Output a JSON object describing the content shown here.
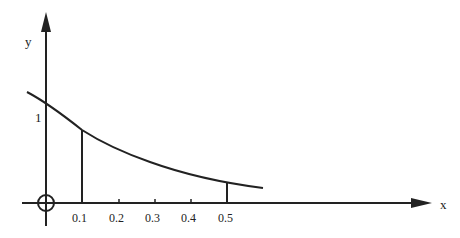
{
  "diagram": {
    "axes": {
      "x_label": "x",
      "y_label": "y",
      "origin_symbol": "circle-cross"
    },
    "y_ticks": [
      {
        "label": "1",
        "value": 1
      }
    ],
    "x_ticks": [
      {
        "label": "0.1",
        "value": 0.1
      },
      {
        "label": "0.2",
        "value": 0.2
      },
      {
        "label": "0.3",
        "value": 0.3
      },
      {
        "label": "0.4",
        "value": 0.4
      },
      {
        "label": "0.5",
        "value": 0.5
      }
    ],
    "curve": {
      "description": "decreasing curve crossing y-axis at 1",
      "vertical_lines_at": [
        0.1,
        0.5
      ]
    },
    "colors": {
      "stroke": "#222222",
      "background": "#ffffff"
    }
  }
}
